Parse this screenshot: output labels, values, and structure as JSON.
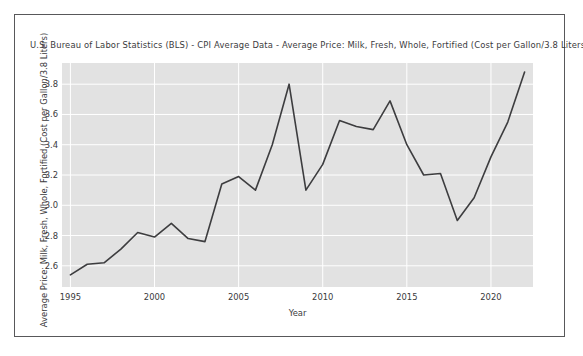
{
  "figure": {
    "title": "U.S. Bureau of Labor Statistics (BLS)  - CPI Average Data - Average Price: Milk, Fresh, Whole, Fortified (Cost per Gallon/3.8 Liters)",
    "background": "#ffffff",
    "plot_background": "#e2e2e2",
    "line_color": "#3d3d3f",
    "grid_color": "#ffffff",
    "frame_color": "#58585a"
  },
  "chart_data": {
    "type": "line",
    "title": "U.S. Bureau of Labor Statistics (BLS)  - CPI Average Data - Average Price: Milk, Fresh, Whole, Fortified (Cost per Gallon/3.8 Liters)",
    "xlabel": "Year",
    "ylabel": "Average Price: Milk, Fresh, Whole, Fortified (Cost per Gallon/3.8 Liters)",
    "xlim": [
      1994.5,
      2022.5
    ],
    "ylim": [
      2.46,
      3.94
    ],
    "xticks": [
      1995,
      2000,
      2005,
      2010,
      2015,
      2020
    ],
    "xtick_labels": [
      "1995",
      "2000",
      "2005",
      "2010",
      "2015",
      "2020"
    ],
    "yticks": [
      2.6,
      2.8,
      3.0,
      3.2,
      3.4,
      3.6,
      3.8
    ],
    "ytick_labels": [
      "2.6",
      "2.8",
      "3.0",
      "3.2",
      "3.4",
      "3.6",
      "3.8"
    ],
    "grid": true,
    "legend": null,
    "x": [
      1995,
      1996,
      1997,
      1998,
      1999,
      2000,
      2001,
      2002,
      2003,
      2004,
      2005,
      2006,
      2007,
      2008,
      2009,
      2010,
      2011,
      2012,
      2013,
      2014,
      2015,
      2016,
      2017,
      2018,
      2019,
      2020,
      2021,
      2022
    ],
    "series": [
      {
        "name": "Average Price: Milk, Fresh, Whole, Fortified (Cost per Gallon/3.8 Liters)",
        "values": [
          2.54,
          2.61,
          2.62,
          2.71,
          2.82,
          2.79,
          2.88,
          2.78,
          2.76,
          3.14,
          3.19,
          3.1,
          3.4,
          3.8,
          3.1,
          3.27,
          3.56,
          3.52,
          3.5,
          3.69,
          3.4,
          3.2,
          3.21,
          2.9,
          3.05,
          3.32,
          3.55,
          3.88
        ],
        "color": "#3d3d3f"
      }
    ]
  }
}
